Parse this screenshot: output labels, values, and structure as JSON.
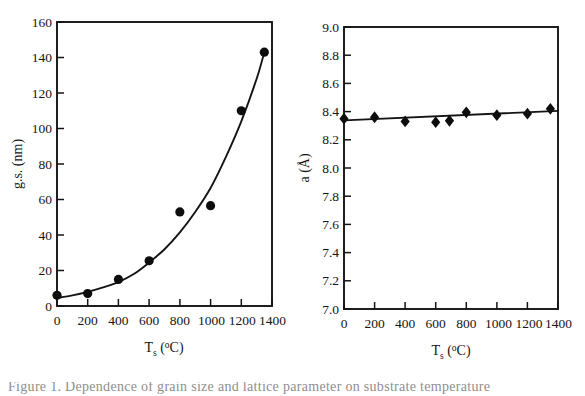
{
  "figure": {
    "background_color": "#ffffff",
    "ink_color": "#141414",
    "caption_partial": "Figure 1. Dependence of grain size and lattice parameter on substrate temperature"
  },
  "chart_data": [
    {
      "type": "scatter",
      "id": "grain-size-vs-temperature",
      "title": "",
      "xlabel": "T_s (°C)",
      "ylabel": "g.s. (nm)",
      "xlabel_parts": {
        "base": "T",
        "sub": "s",
        "paren_open": " (",
        "sup": "o",
        "unit": "C)"
      },
      "ylabel_parts": {
        "base": "g.s. (nm)"
      },
      "xlim": [
        0,
        1400
      ],
      "ylim": [
        0,
        160
      ],
      "xticks": [
        0,
        200,
        400,
        600,
        800,
        1000,
        1200,
        1400
      ],
      "yticks": [
        0,
        20,
        40,
        60,
        80,
        100,
        120,
        140,
        160
      ],
      "xticklabels": [
        "0",
        "200",
        "400",
        "600",
        "800",
        "1000",
        "1200",
        "1400"
      ],
      "yticklabels": [
        "0",
        "20",
        "40",
        "60",
        "80",
        "100",
        "120",
        "140",
        "160"
      ],
      "grid": false,
      "legend": false,
      "marker": "filled-circle",
      "series": [
        {
          "name": "grain size",
          "marker": "filled-circle",
          "x": [
            0,
            200,
            400,
            600,
            800,
            1000,
            1200,
            1350
          ],
          "y": [
            6,
            7,
            15,
            25.5,
            53,
            56.5,
            110,
            143
          ]
        }
      ],
      "fit_curve": {
        "name": "guide-to-the-eye exponential fit",
        "x": [
          0,
          100,
          200,
          300,
          400,
          500,
          600,
          700,
          800,
          900,
          1000,
          1100,
          1200,
          1300,
          1350
        ],
        "y": [
          4.5,
          6.0,
          8.0,
          10.5,
          13.5,
          18.0,
          24.5,
          32.0,
          41.5,
          53.0,
          66.5,
          84.0,
          104.0,
          128.0,
          143.0
        ]
      }
    },
    {
      "type": "scatter",
      "id": "lattice-parameter-vs-temperature",
      "title": "",
      "xlabel": "T_s (°C)",
      "ylabel": "a (Å)",
      "xlabel_parts": {
        "base": "T",
        "sub": "s",
        "paren_open": " (",
        "sup": "o",
        "unit": "C)"
      },
      "ylabel_parts": {
        "base": "a (Å)"
      },
      "xlim": [
        0,
        1400
      ],
      "ylim": [
        7.0,
        9.0
      ],
      "xticks": [
        0,
        200,
        400,
        600,
        800,
        1000,
        1200,
        1400
      ],
      "yticks": [
        7.0,
        7.2,
        7.4,
        7.6,
        7.8,
        8.0,
        8.2,
        8.4,
        8.6,
        8.8,
        9.0
      ],
      "xticklabels": [
        "0",
        "200",
        "400",
        "600",
        "800",
        "1000",
        "1200",
        "1400"
      ],
      "yticklabels": [
        "7.0",
        "7.2",
        "7.4",
        "7.6",
        "7.8",
        "8.0",
        "8.2",
        "8.4",
        "8.6",
        "8.8",
        "9.0"
      ],
      "grid": false,
      "legend": false,
      "marker": "filled-diamond",
      "series": [
        {
          "name": "lattice parameter",
          "marker": "filled-diamond",
          "x": [
            0,
            200,
            400,
            600,
            690,
            800,
            1000,
            1200,
            1350
          ],
          "y": [
            8.35,
            8.36,
            8.33,
            8.325,
            8.335,
            8.395,
            8.375,
            8.385,
            8.42
          ]
        }
      ],
      "fit_curve": {
        "name": "linear fit",
        "x": [
          0,
          1400
        ],
        "y": [
          8.338,
          8.405
        ]
      }
    }
  ]
}
